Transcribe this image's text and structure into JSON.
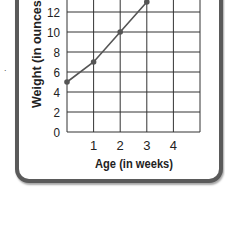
{
  "chart_data": {
    "type": "line",
    "title": "",
    "xlabel": "Age (in weeks)",
    "ylabel": "Weight (in ounces)",
    "x": [
      0,
      1,
      2,
      3
    ],
    "series": [
      {
        "name": "Weight",
        "values": [
          5,
          7,
          10,
          13
        ]
      }
    ],
    "x_ticks": [
      "1",
      "2",
      "3",
      "4"
    ],
    "y_ticks": [
      "0",
      "2",
      "4",
      "6",
      "8",
      "10",
      "12"
    ],
    "xlim": [
      0,
      5
    ],
    "ylim": [
      0,
      14
    ],
    "grid": true,
    "legend": null,
    "colors": {
      "line": "#555555",
      "grid": "#333333",
      "frame": "#5a5a5a"
    }
  },
  "labels": {
    "xlabel": "Age (in weeks)",
    "ylabel": "Weight (in ounces)",
    "stray_mark": "."
  }
}
